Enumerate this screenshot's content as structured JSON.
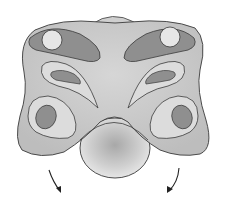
{
  "diagram": {
    "type": "illustration",
    "colors": {
      "background": "#ffffff",
      "body_fill": "#c9c9c9",
      "lobe_fill": "#dcdcdc",
      "dark_patch": "#8f8f8f",
      "light_spot": "#e6e6e6",
      "outline": "#3a3a3a",
      "bulb_fill": "#d4d4d4",
      "arrow": "#222222"
    },
    "elements": [
      {
        "name": "top-cap"
      },
      {
        "name": "left-upper-patch"
      },
      {
        "name": "right-upper-patch"
      },
      {
        "name": "left-middle-lobe"
      },
      {
        "name": "right-middle-lobe"
      },
      {
        "name": "left-lower-lobe"
      },
      {
        "name": "right-lower-lobe"
      },
      {
        "name": "bottom-bulb"
      },
      {
        "name": "left-arrow"
      },
      {
        "name": "right-arrow"
      }
    ]
  }
}
